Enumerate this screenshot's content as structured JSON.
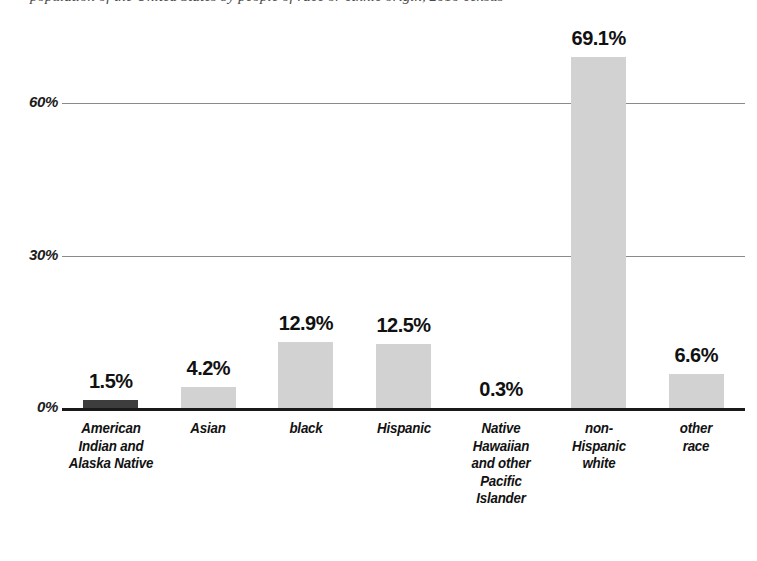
{
  "caption": {
    "text": "population of the United States by people of race or ethnic origin, 2010 census"
  },
  "chart_data": {
    "type": "bar",
    "title": "",
    "xlabel": "",
    "ylabel": "",
    "categories": [
      "American Indian and Alaska Native",
      "Asian",
      "black",
      "Hispanic",
      "Native Hawaiian and other Pacific Islander",
      "non-Hispanic white",
      "other race"
    ],
    "category_lines": [
      [
        "American",
        "Indian  and",
        "Alaska Native"
      ],
      [
        "Asian"
      ],
      [
        "black"
      ],
      [
        "Hispanic"
      ],
      [
        "Native",
        "Hawaiian",
        "and other",
        "Pacific",
        "Islander"
      ],
      [
        "non-",
        "Hispanic",
        "white"
      ],
      [
        "other",
        "race"
      ]
    ],
    "values": [
      1.5,
      4.2,
      12.9,
      12.5,
      0.3,
      69.1,
      6.6
    ],
    "value_labels": [
      "1.5%",
      "4.2%",
      "12.9%",
      "12.5%",
      "0.3%",
      "69.1%",
      "6.6%"
    ],
    "ylim": [
      0,
      75
    ],
    "yticks": [
      0,
      30,
      60
    ],
    "ytick_labels": [
      "0%",
      "30%",
      "60%"
    ],
    "grid": true,
    "legend": "none",
    "bar_colors": [
      "#3d3d3d",
      "#d2d2d2",
      "#d2d2d2",
      "#d2d2d2",
      "#d2d2d2",
      "#d2d2d2",
      "#d2d2d2"
    ],
    "axis_color": "#1a1a1a",
    "gridline_color": "#8a8a8a"
  }
}
